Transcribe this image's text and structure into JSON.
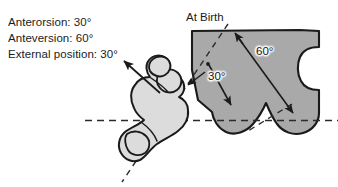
{
  "figure": {
    "caption_title": "At Birth",
    "annotations": [
      "Anterorsion: 30°",
      "Anteversion: 60°",
      "External position: 30°"
    ],
    "angle_labels": [
      {
        "id": "anteversion-angle",
        "text": "60°"
      },
      {
        "id": "anterorsion-angle",
        "text": "30°"
      }
    ],
    "measurements": {
      "anterorsion_deg": 30,
      "anteversion_deg": 60,
      "external_position_deg": 30
    },
    "colors": {
      "pelvis_fill": "#a9a9a9",
      "femur_fill": "#dcdcdc",
      "outline": "#1a1a1a",
      "dashed_line": "#2b2b2b",
      "background": "#ffffff",
      "text": "#1b1b1b"
    },
    "elements": {
      "pelvis_name": "pelvis-block",
      "femur_name": "proximal-femur",
      "horizontal_axis_name": "horizontal-reference-axis",
      "oblique_axis_name": "oblique-reference-axis",
      "femoral_neck_axis_name": "femoral-neck-axis-arrow",
      "anteversion_arrow_name": "anteversion-angle-arrow",
      "anterorsion_arrow_name": "anterorsion-angle-arrow"
    }
  }
}
